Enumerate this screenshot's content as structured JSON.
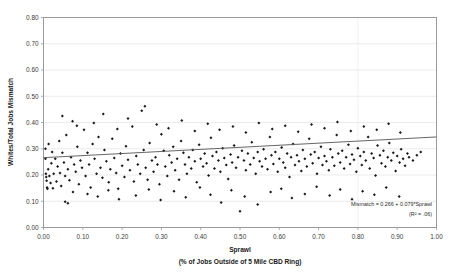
{
  "chart_data": {
    "type": "scatter",
    "title": "",
    "xlabel": "Sprawl",
    "xlabel_sub": "(% of Jobs Outside of 5 Mile CBD Ring)",
    "ylabel": "Whites/Total Jobs Mismatch",
    "xlim": [
      0.0,
      1.0
    ],
    "ylim": [
      0.0,
      0.8
    ],
    "xticks": [
      "0.00",
      "0.10",
      "0.20",
      "0.30",
      "0.40",
      "0.50",
      "0.60",
      "0.70",
      "0.80",
      "0.90",
      "1.00"
    ],
    "yticks": [
      "0.00",
      "0.10",
      "0.20",
      "0.30",
      "0.40",
      "0.50",
      "0.60",
      "0.70",
      "0.80"
    ],
    "grid": "horizontal-faint",
    "legend": "none",
    "marker_color": "#1a1a1a",
    "trendline_color": "#555555",
    "annotations": [
      "Mismatch = 0.266 + 0.079*Sprawl",
      "(R² = .06)"
    ],
    "regression": {
      "intercept": 0.266,
      "slope": 0.079,
      "r_squared": 0.06
    },
    "points": [
      [
        0.005,
        0.3
      ],
      [
        0.005,
        0.262
      ],
      [
        0.006,
        0.205
      ],
      [
        0.007,
        0.192
      ],
      [
        0.008,
        0.178
      ],
      [
        0.009,
        0.152
      ],
      [
        0.01,
        0.148
      ],
      [
        0.012,
        0.222
      ],
      [
        0.013,
        0.318
      ],
      [
        0.015,
        0.196
      ],
      [
        0.018,
        0.17
      ],
      [
        0.02,
        0.245
      ],
      [
        0.022,
        0.288
      ],
      [
        0.024,
        0.15
      ],
      [
        0.026,
        0.205
      ],
      [
        0.03,
        0.262
      ],
      [
        0.033,
        0.175
      ],
      [
        0.036,
        0.232
      ],
      [
        0.04,
        0.33
      ],
      [
        0.042,
        0.208
      ],
      [
        0.045,
        0.158
      ],
      [
        0.048,
        0.285
      ],
      [
        0.052,
        0.248
      ],
      [
        0.055,
        0.196
      ],
      [
        0.058,
        0.352
      ],
      [
        0.062,
        0.222
      ],
      [
        0.066,
        0.18
      ],
      [
        0.07,
        0.268
      ],
      [
        0.074,
        0.405
      ],
      [
        0.078,
        0.24
      ],
      [
        0.082,
        0.212
      ],
      [
        0.086,
        0.308
      ],
      [
        0.09,
        0.165
      ],
      [
        0.094,
        0.255
      ],
      [
        0.098,
        0.228
      ],
      [
        0.103,
        0.372
      ],
      [
        0.107,
        0.196
      ],
      [
        0.112,
        0.285
      ],
      [
        0.116,
        0.24
      ],
      [
        0.12,
        0.152
      ],
      [
        0.125,
        0.318
      ],
      [
        0.13,
        0.262
      ],
      [
        0.135,
        0.205
      ],
      [
        0.14,
        0.345
      ],
      [
        0.145,
        0.228
      ],
      [
        0.15,
        0.19
      ],
      [
        0.155,
        0.295
      ],
      [
        0.16,
        0.252
      ],
      [
        0.166,
        0.172
      ],
      [
        0.17,
        0.222
      ],
      [
        0.175,
        0.338
      ],
      [
        0.18,
        0.265
      ],
      [
        0.185,
        0.208
      ],
      [
        0.19,
        0.148
      ],
      [
        0.196,
        0.282
      ],
      [
        0.2,
        0.235
      ],
      [
        0.206,
        0.192
      ],
      [
        0.21,
        0.31
      ],
      [
        0.215,
        0.258
      ],
      [
        0.22,
        0.218
      ],
      [
        0.226,
        0.385
      ],
      [
        0.23,
        0.175
      ],
      [
        0.236,
        0.272
      ],
      [
        0.24,
        0.24
      ],
      [
        0.246,
        0.205
      ],
      [
        0.25,
        0.445
      ],
      [
        0.255,
        0.295
      ],
      [
        0.26,
        0.228
      ],
      [
        0.265,
        0.182
      ],
      [
        0.27,
        0.322
      ],
      [
        0.276,
        0.255
      ],
      [
        0.28,
        0.212
      ],
      [
        0.285,
        0.268
      ],
      [
        0.29,
        0.24
      ],
      [
        0.295,
        0.165
      ],
      [
        0.3,
        0.355
      ],
      [
        0.306,
        0.292
      ],
      [
        0.31,
        0.232
      ],
      [
        0.315,
        0.196
      ],
      [
        0.32,
        0.275
      ],
      [
        0.326,
        0.248
      ],
      [
        0.33,
        0.308
      ],
      [
        0.335,
        0.218
      ],
      [
        0.34,
        0.262
      ],
      [
        0.345,
        0.182
      ],
      [
        0.35,
        0.33
      ],
      [
        0.356,
        0.285
      ],
      [
        0.36,
        0.24
      ],
      [
        0.365,
        0.205
      ],
      [
        0.37,
        0.268
      ],
      [
        0.376,
        0.225
      ],
      [
        0.38,
        0.295
      ],
      [
        0.385,
        0.252
      ],
      [
        0.39,
        0.172
      ],
      [
        0.396,
        0.315
      ],
      [
        0.4,
        0.262
      ],
      [
        0.406,
        0.232
      ],
      [
        0.41,
        0.282
      ],
      [
        0.415,
        0.245
      ],
      [
        0.42,
        0.198
      ],
      [
        0.426,
        0.342
      ],
      [
        0.43,
        0.272
      ],
      [
        0.435,
        0.225
      ],
      [
        0.44,
        0.288
      ],
      [
        0.445,
        0.255
      ],
      [
        0.45,
        0.212
      ],
      [
        0.456,
        0.302
      ],
      [
        0.46,
        0.265
      ],
      [
        0.465,
        0.238
      ],
      [
        0.47,
        0.185
      ],
      [
        0.476,
        0.278
      ],
      [
        0.48,
        0.248
      ],
      [
        0.485,
        0.312
      ],
      [
        0.49,
        0.228
      ],
      [
        0.495,
        0.268
      ],
      [
        0.5,
        0.062
      ],
      [
        0.505,
        0.292
      ],
      [
        0.51,
        0.255
      ],
      [
        0.515,
        0.218
      ],
      [
        0.52,
        0.282
      ],
      [
        0.526,
        0.24
      ],
      [
        0.53,
        0.325
      ],
      [
        0.535,
        0.265
      ],
      [
        0.54,
        0.205
      ],
      [
        0.545,
        0.288
      ],
      [
        0.55,
        0.252
      ],
      [
        0.556,
        0.232
      ],
      [
        0.56,
        0.298
      ],
      [
        0.565,
        0.262
      ],
      [
        0.57,
        0.222
      ],
      [
        0.576,
        0.345
      ],
      [
        0.58,
        0.275
      ],
      [
        0.585,
        0.242
      ],
      [
        0.59,
        0.288
      ],
      [
        0.596,
        0.212
      ],
      [
        0.6,
        0.262
      ],
      [
        0.606,
        0.305
      ],
      [
        0.61,
        0.248
      ],
      [
        0.615,
        0.228
      ],
      [
        0.62,
        0.282
      ],
      [
        0.626,
        0.192
      ],
      [
        0.63,
        0.268
      ],
      [
        0.635,
        0.318
      ],
      [
        0.64,
        0.238
      ],
      [
        0.645,
        0.275
      ],
      [
        0.65,
        0.252
      ],
      [
        0.656,
        0.215
      ],
      [
        0.66,
        0.295
      ],
      [
        0.665,
        0.262
      ],
      [
        0.67,
        0.232
      ],
      [
        0.676,
        0.338
      ],
      [
        0.68,
        0.278
      ],
      [
        0.685,
        0.245
      ],
      [
        0.69,
        0.288
      ],
      [
        0.696,
        0.205
      ],
      [
        0.7,
        0.265
      ],
      [
        0.706,
        0.308
      ],
      [
        0.71,
        0.238
      ],
      [
        0.715,
        0.272
      ],
      [
        0.72,
        0.252
      ],
      [
        0.726,
        0.218
      ],
      [
        0.73,
        0.298
      ],
      [
        0.735,
        0.268
      ],
      [
        0.74,
        0.235
      ],
      [
        0.746,
        0.352
      ],
      [
        0.75,
        0.282
      ],
      [
        0.755,
        0.248
      ],
      [
        0.76,
        0.292
      ],
      [
        0.765,
        0.225
      ],
      [
        0.77,
        0.268
      ],
      [
        0.776,
        0.315
      ],
      [
        0.78,
        0.242
      ],
      [
        0.785,
        0.278
      ],
      [
        0.79,
        0.258
      ],
      [
        0.796,
        0.212
      ],
      [
        0.8,
        0.302
      ],
      [
        0.806,
        0.272
      ],
      [
        0.81,
        0.238
      ],
      [
        0.815,
        0.288
      ],
      [
        0.82,
        0.255
      ],
      [
        0.826,
        0.345
      ],
      [
        0.83,
        0.225
      ],
      [
        0.835,
        0.282
      ],
      [
        0.84,
        0.265
      ],
      [
        0.845,
        0.198
      ],
      [
        0.85,
        0.312
      ],
      [
        0.856,
        0.275
      ],
      [
        0.86,
        0.245
      ],
      [
        0.865,
        0.292
      ],
      [
        0.87,
        0.232
      ],
      [
        0.876,
        0.268
      ],
      [
        0.88,
        0.322
      ],
      [
        0.885,
        0.255
      ],
      [
        0.89,
        0.285
      ],
      [
        0.896,
        0.215
      ],
      [
        0.9,
        0.272
      ],
      [
        0.906,
        0.248
      ],
      [
        0.91,
        0.298
      ],
      [
        0.915,
        0.262
      ],
      [
        0.92,
        0.235
      ],
      [
        0.926,
        0.282
      ],
      [
        0.93,
        0.268
      ],
      [
        0.94,
        0.255
      ],
      [
        0.95,
        0.275
      ],
      [
        0.96,
        0.288
      ],
      [
        0.055,
        0.098
      ],
      [
        0.062,
        0.092
      ],
      [
        0.075,
        0.135
      ],
      [
        0.112,
        0.128
      ],
      [
        0.138,
        0.118
      ],
      [
        0.165,
        0.142
      ],
      [
        0.192,
        0.108
      ],
      [
        0.235,
        0.122
      ],
      [
        0.268,
        0.145
      ],
      [
        0.298,
        0.105
      ],
      [
        0.332,
        0.138
      ],
      [
        0.362,
        0.115
      ],
      [
        0.398,
        0.152
      ],
      [
        0.425,
        0.125
      ],
      [
        0.452,
        0.095
      ],
      [
        0.478,
        0.142
      ],
      [
        0.512,
        0.118
      ],
      [
        0.545,
        0.088
      ],
      [
        0.578,
        0.135
      ],
      [
        0.605,
        0.148
      ],
      [
        0.632,
        0.112
      ],
      [
        0.665,
        0.128
      ],
      [
        0.695,
        0.155
      ],
      [
        0.728,
        0.122
      ],
      [
        0.755,
        0.145
      ],
      [
        0.785,
        0.108
      ],
      [
        0.812,
        0.138
      ],
      [
        0.842,
        0.125
      ],
      [
        0.872,
        0.152
      ],
      [
        0.905,
        0.118
      ],
      [
        0.048,
        0.425
      ],
      [
        0.085,
        0.388
      ],
      [
        0.128,
        0.398
      ],
      [
        0.152,
        0.432
      ],
      [
        0.188,
        0.375
      ],
      [
        0.215,
        0.415
      ],
      [
        0.258,
        0.462
      ],
      [
        0.288,
        0.392
      ],
      [
        0.318,
        0.378
      ],
      [
        0.352,
        0.408
      ],
      [
        0.385,
        0.368
      ],
      [
        0.418,
        0.395
      ],
      [
        0.448,
        0.372
      ],
      [
        0.482,
        0.385
      ],
      [
        0.515,
        0.362
      ],
      [
        0.548,
        0.398
      ],
      [
        0.582,
        0.375
      ],
      [
        0.615,
        0.388
      ],
      [
        0.648,
        0.365
      ],
      [
        0.682,
        0.392
      ],
      [
        0.715,
        0.378
      ],
      [
        0.748,
        0.402
      ],
      [
        0.782,
        0.368
      ],
      [
        0.815,
        0.385
      ],
      [
        0.848,
        0.372
      ],
      [
        0.878,
        0.395
      ],
      [
        0.908,
        0.362
      ]
    ]
  }
}
